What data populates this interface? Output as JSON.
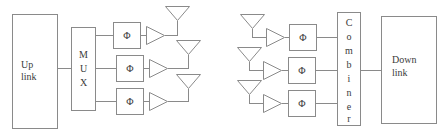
{
  "diagram": {
    "canvas": {
      "width": 442,
      "height": 135,
      "background": "#ffffff"
    },
    "colors": {
      "stroke": "#8a8a8a",
      "text": "#3b3b3b",
      "fill": "#ffffff"
    },
    "left_chain": {
      "name": "uplink-transmit-chain",
      "source_block": {
        "label_line1": "Up",
        "label_line2": "link"
      },
      "mux_block": {
        "letters": [
          "M",
          "U",
          "X"
        ],
        "label": "MUX"
      },
      "branches": [
        {
          "phase_shifter": "Φ",
          "amplifier": "amp",
          "antenna": "antenna"
        },
        {
          "phase_shifter": "Φ",
          "amplifier": "amp",
          "antenna": "antenna"
        },
        {
          "phase_shifter": "Φ",
          "amplifier": "amp",
          "antenna": "antenna"
        }
      ]
    },
    "right_chain": {
      "name": "downlink-receive-chain",
      "branches": [
        {
          "antenna": "antenna",
          "amplifier": "amp",
          "phase_shifter": "Φ"
        },
        {
          "antenna": "antenna",
          "amplifier": "amp",
          "phase_shifter": "Φ"
        },
        {
          "antenna": "antenna",
          "amplifier": "amp",
          "phase_shifter": "Φ"
        }
      ],
      "combiner_block": {
        "letters": [
          "C",
          "o",
          "m",
          "b",
          "i",
          "n",
          "e",
          "r"
        ],
        "label": "Combiner"
      },
      "sink_block": {
        "label_line1": "Down",
        "label_line2": "link"
      }
    }
  }
}
